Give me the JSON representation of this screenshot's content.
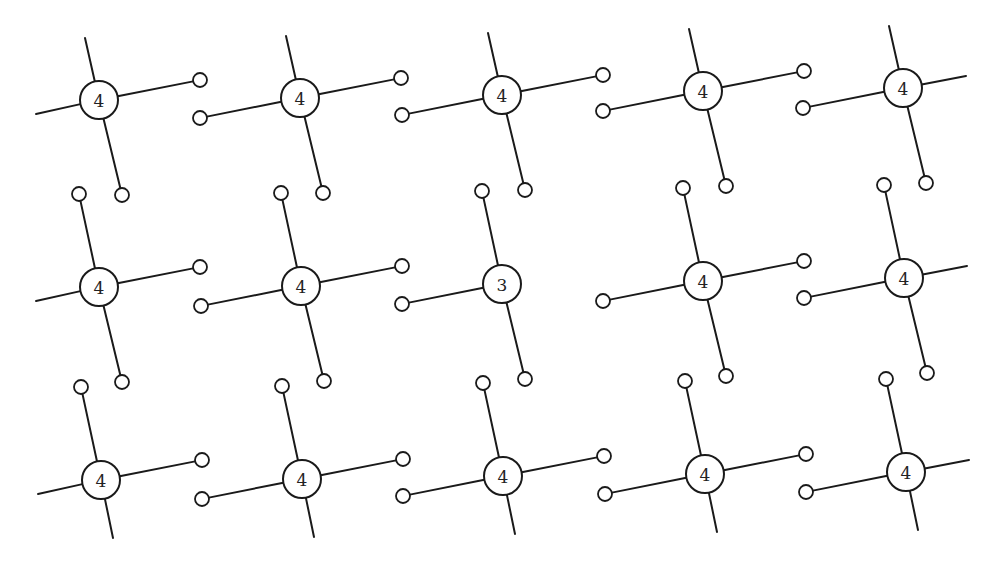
{
  "diagram": {
    "type": "crystal-lattice-bonds",
    "rows": 3,
    "cols": 5,
    "atom_radius": 19,
    "electron_radius": 7,
    "colors": {
      "line": "#1a1a1a",
      "background": "#ffffff"
    },
    "atoms": [
      {
        "row": 0,
        "col": 0,
        "x": 99,
        "y": 100,
        "label": "4",
        "bonds": [
          "up",
          "right",
          "down",
          "left"
        ]
      },
      {
        "row": 0,
        "col": 1,
        "x": 300,
        "y": 98,
        "label": "4",
        "bonds": [
          "up",
          "right",
          "down",
          "left"
        ]
      },
      {
        "row": 0,
        "col": 2,
        "x": 502,
        "y": 95,
        "label": "4",
        "bonds": [
          "up",
          "right",
          "down",
          "left"
        ]
      },
      {
        "row": 0,
        "col": 3,
        "x": 703,
        "y": 91,
        "label": "4",
        "bonds": [
          "up",
          "right",
          "down",
          "left"
        ]
      },
      {
        "row": 0,
        "col": 4,
        "x": 903,
        "y": 88,
        "label": "4",
        "bonds": [
          "up",
          "right",
          "down",
          "left"
        ]
      },
      {
        "row": 1,
        "col": 0,
        "x": 99,
        "y": 287,
        "label": "4",
        "bonds": [
          "up",
          "right",
          "down",
          "left"
        ]
      },
      {
        "row": 1,
        "col": 1,
        "x": 301,
        "y": 286,
        "label": "4",
        "bonds": [
          "up",
          "right",
          "down",
          "left"
        ]
      },
      {
        "row": 1,
        "col": 2,
        "x": 502,
        "y": 284,
        "label": "3",
        "bonds": [
          "up",
          "down",
          "left"
        ]
      },
      {
        "row": 1,
        "col": 3,
        "x": 703,
        "y": 281,
        "label": "4",
        "bonds": [
          "up",
          "right",
          "down",
          "left"
        ]
      },
      {
        "row": 1,
        "col": 4,
        "x": 904,
        "y": 278,
        "label": "4",
        "bonds": [
          "up",
          "right",
          "down",
          "left"
        ]
      },
      {
        "row": 2,
        "col": 0,
        "x": 101,
        "y": 480,
        "label": "4",
        "bonds": [
          "up",
          "right",
          "down",
          "left"
        ]
      },
      {
        "row": 2,
        "col": 1,
        "x": 302,
        "y": 479,
        "label": "4",
        "bonds": [
          "up",
          "right",
          "down",
          "left"
        ]
      },
      {
        "row": 2,
        "col": 2,
        "x": 503,
        "y": 476,
        "label": "4",
        "bonds": [
          "up",
          "right",
          "down",
          "left"
        ]
      },
      {
        "row": 2,
        "col": 3,
        "x": 705,
        "y": 474,
        "label": "4",
        "bonds": [
          "up",
          "right",
          "down",
          "left"
        ]
      },
      {
        "row": 2,
        "col": 4,
        "x": 906,
        "y": 472,
        "label": "4",
        "bonds": [
          "up",
          "right",
          "down",
          "left"
        ]
      }
    ]
  }
}
